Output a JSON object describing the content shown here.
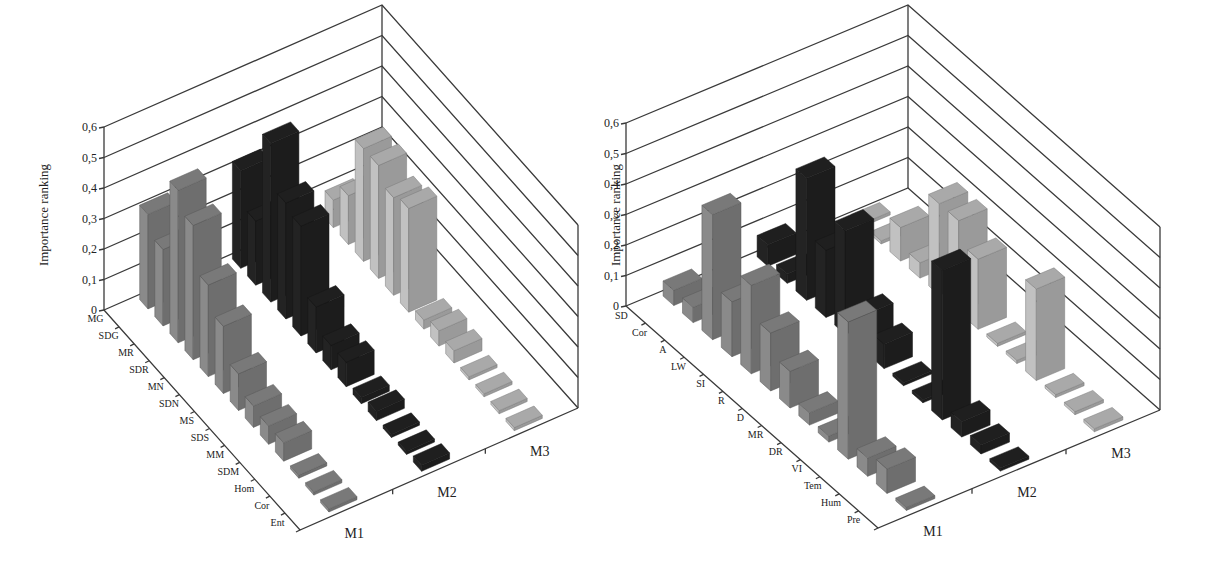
{
  "chart_data": [
    {
      "type": "bar",
      "subtype": "3d-bar",
      "title": "",
      "ylabel": "Importance ranking",
      "xlabel": "",
      "ylim": [
        0,
        0.6
      ],
      "yticks": [
        "0",
        "0,1",
        "0,2",
        "0,3",
        "0,4",
        "0,5",
        "0,6"
      ],
      "grid": true,
      "legend": "none",
      "categories": [
        "MG",
        "SDG",
        "MR",
        "SDR",
        "MN",
        "SDN",
        "MS",
        "SDS",
        "MM",
        "SDM",
        "Hom",
        "Cor",
        "Ent"
      ],
      "series": [
        {
          "name": "M1",
          "color": "#6e6e6e",
          "values": [
            0.31,
            0.25,
            0.5,
            0.44,
            0.3,
            0.22,
            0.12,
            0.07,
            0.06,
            0.06,
            0.01,
            0.01,
            0.01
          ]
        },
        {
          "name": "M2",
          "color": "#1c1c1c",
          "values": [
            0.32,
            0.21,
            0.52,
            0.38,
            0.36,
            0.15,
            0.08,
            0.08,
            0.02,
            0.03,
            0.01,
            0.01,
            0.02
          ]
        },
        {
          "name": "M3",
          "color": "#9a9a9a",
          "values": [
            0.09,
            0.16,
            0.37,
            0.37,
            0.32,
            0.34,
            0.03,
            0.05,
            0.04,
            0.01,
            0.01,
            0.01,
            0.01
          ]
        }
      ]
    },
    {
      "type": "bar",
      "subtype": "3d-bar",
      "title": "",
      "ylabel": "Importance ranking",
      "xlabel": "",
      "ylim": [
        0,
        0.6
      ],
      "yticks": [
        "0",
        "0,1",
        "0,2",
        "0,3",
        "0,4",
        "0,5",
        "0,6"
      ],
      "grid": true,
      "legend": "none",
      "categories": [
        "SD",
        "Cor",
        "A",
        "LW",
        "SI",
        "R",
        "D",
        "MR",
        "DR",
        "VI",
        "Tem",
        "Hum",
        "Pre"
      ],
      "series": [
        {
          "name": "M1",
          "color": "#6e6e6e",
          "values": [
            0.05,
            0.05,
            0.41,
            0.18,
            0.29,
            0.19,
            0.12,
            0.04,
            0.02,
            0.45,
            0.06,
            0.08,
            0.01
          ]
        },
        {
          "name": "M2",
          "color": "#1c1c1c",
          "values": [
            0.07,
            0.03,
            0.4,
            0.22,
            0.34,
            0.12,
            0.08,
            0.01,
            0.01,
            0.49,
            0.05,
            0.03,
            0.01
          ]
        },
        {
          "name": "M3",
          "color": "#9a9a9a",
          "values": [
            0.01,
            0.01,
            0.11,
            0.05,
            0.3,
            0.3,
            0.23,
            0.01,
            0.01,
            0.3,
            0.01,
            0.01,
            0.01
          ]
        }
      ]
    }
  ],
  "charts": [
    {
      "ylabel": "Importance ranking",
      "yticks": [
        "0",
        "0,1",
        "0,2",
        "0,3",
        "0,4",
        "0,5",
        "0,6"
      ],
      "series_labels": [
        "M1",
        "M2",
        "M3"
      ]
    },
    {
      "ylabel": "Importance ranking",
      "yticks": [
        "0",
        "0,1",
        "0,2",
        "0,3",
        "0,4",
        "0,5",
        "0,6"
      ],
      "series_labels": [
        "M1",
        "M2",
        "M3"
      ]
    }
  ]
}
